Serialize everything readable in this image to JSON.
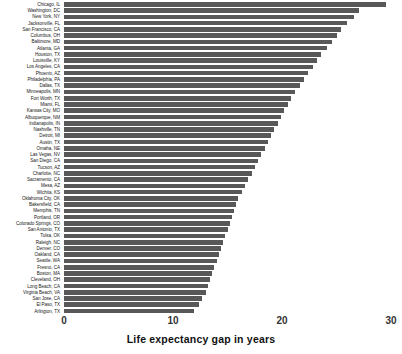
{
  "chart_data": {
    "type": "bar",
    "orientation": "horizontal",
    "title": "",
    "xlabel": "Life expectancy gap in years",
    "ylabel": "",
    "xlim": [
      0,
      31
    ],
    "xticks": [
      0,
      10,
      20,
      30
    ],
    "xtick_labels": [
      "0",
      "10",
      "20",
      "30"
    ],
    "grid": false,
    "legend": false,
    "bar_color": "#585858",
    "background_color": "#ffffff",
    "categories": [
      "Chicago, IL",
      "Washington, DC",
      "New York, NY",
      "Jacksonville, FL",
      "San Francisco, CA",
      "Columbus, OH",
      "Baltimore, MD",
      "Atlanta, GA",
      "Houston, TX",
      "Louisville, KY",
      "Los Angeles, CA",
      "Phoenix, AZ",
      "Philadelphia, PA",
      "Dallas, TX",
      "Minneapolis, MN",
      "Fort Worth, TX",
      "Miami, FL",
      "Kansas City, MO",
      "Albuquerque, NM",
      "Indianapolis, IN",
      "Nashville, TN",
      "Detroit, MI",
      "Austin, TX",
      "Omaha, NE",
      "Las Vegas, NV",
      "San Diego, CA",
      "Tucson, AZ",
      "Charlotte, NC",
      "Sacramento, CA",
      "Mesa, AZ",
      "Wichita, KS",
      "Oklahoma City, OK",
      "Bakersfield, CA",
      "Memphis, TN",
      "Portland, OR",
      "Colorado Springs, CO",
      "San Antonio, TX",
      "Tulsa, OK",
      "Raleigh, NC",
      "Denver, CO",
      "Oakland, CA",
      "Seattle, WA",
      "Fresno, CA",
      "Boston, MA",
      "Cleveland, OH",
      "Long Beach, CA",
      "Virginia Beach, VA",
      "San Jose, CA",
      "El Paso, TX",
      "Arlington, TX"
    ],
    "values": [
      29.5,
      27.1,
      26.6,
      26.0,
      25.4,
      25.0,
      24.6,
      24.1,
      23.6,
      23.2,
      22.8,
      22.4,
      22.0,
      21.6,
      21.2,
      20.8,
      20.5,
      20.2,
      19.9,
      19.6,
      19.3,
      19.0,
      18.7,
      18.4,
      18.1,
      17.8,
      17.5,
      17.2,
      16.9,
      16.6,
      16.3,
      16.0,
      15.8,
      15.6,
      15.4,
      15.2,
      15.0,
      14.8,
      14.6,
      14.4,
      14.2,
      14.0,
      13.8,
      13.6,
      13.4,
      13.2,
      13.0,
      12.7,
      12.4,
      11.9
    ]
  }
}
